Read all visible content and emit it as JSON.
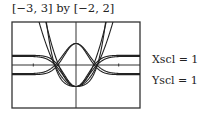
{
  "window": {
    "xmin": -3,
    "xmax": 3,
    "ymin": -2,
    "ymax": 2
  },
  "labels": {
    "title": "[−3, 3] by [−2, 2]",
    "xscl": "Xscl = 1",
    "yscl": "Yscl = 1"
  },
  "chart_data": {
    "type": "line",
    "title": "[−3, 3] by [−2, 2]",
    "xlabel": "",
    "ylabel": "",
    "xlim": [
      -3,
      3
    ],
    "ylim": [
      -2,
      2
    ],
    "xscl": 1,
    "yscl": 1,
    "grid": false,
    "series": [
      {
        "name": "outer curve A",
        "x": [
          -1.45,
          -1.2,
          -1,
          -0.5,
          0,
          0.5,
          1,
          1.2,
          1.45
        ],
        "y": [
          2,
          0.9,
          0,
          -0.75,
          -1,
          -0.75,
          0,
          0.9,
          2
        ]
      },
      {
        "name": "outer curve B",
        "x": [
          -1.4,
          -1.2,
          -1,
          1,
          1.2,
          1.4
        ],
        "y": [
          2,
          1.1,
          0,
          0,
          1.1,
          2
        ]
      },
      {
        "name": "bell curve",
        "x": [
          -1.5,
          -1,
          -0.5,
          0,
          0.5,
          1,
          1.5
        ],
        "y": [
          -0.3,
          0.1,
          0.8,
          1,
          0.8,
          0.1,
          -0.3
        ]
      },
      {
        "name": "diamond lower",
        "x": [
          -1.6,
          -1,
          -0.5,
          0,
          0.5,
          1,
          1.6
        ],
        "y": [
          0.3,
          -0.1,
          -0.75,
          -1,
          -0.75,
          -0.1,
          0.3
        ]
      }
    ]
  }
}
